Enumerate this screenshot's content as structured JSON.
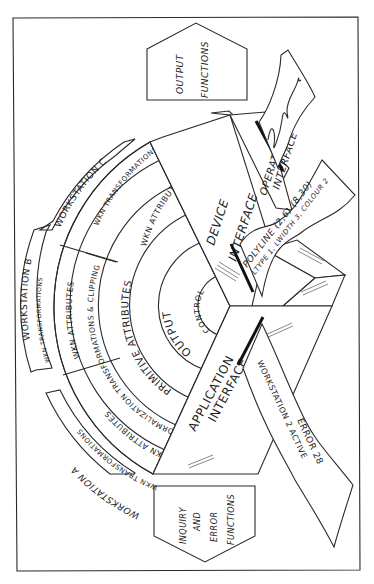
{
  "diagram": {
    "type": "GKS layer model illustration",
    "core": {
      "center_label": "CONTROL",
      "rings": [
        {
          "id": "output",
          "label": "OUTPUT"
        },
        {
          "id": "primitive-attributes",
          "label": "PRIMITIVE ATTRIBUTES"
        },
        {
          "id": "normalization",
          "label": "NORMALIZATION TRANSFORMATIONS & CLIPPING"
        }
      ]
    },
    "workstations": [
      {
        "id": "A",
        "label": "WORKSTATION A",
        "attributes": "WKN ATTRIBUTES",
        "transformations": "WKN TRANSFORMATIONS"
      },
      {
        "id": "B",
        "label": "WORKSTATION B",
        "attributes": "WKN ATTRIBUTES",
        "transformations": "WKN TRANSFORMATIONS"
      },
      {
        "id": "C",
        "label": "WORKSTATION C",
        "attributes": "WKN ATTRIBUTES",
        "transformations": "WKN TRANSFORMATIONS"
      }
    ],
    "interfaces": {
      "application": {
        "line1": "APPLICATION",
        "line2": "INTERFACE"
      },
      "device": {
        "line1": "DEVICE",
        "line2": "INTERFACE"
      },
      "operator": {
        "line1": "OPERATOR",
        "line2": "INTERFACE"
      }
    },
    "function_boxes": {
      "output": {
        "line1": "OUTPUT",
        "line2": "FUNCTIONS"
      },
      "inquiry": {
        "line1": "INQUIRY",
        "line2": "AND",
        "line3": "ERROR",
        "line4": "FUNCTIONS"
      }
    },
    "paper_strips": {
      "device_command": {
        "line1": "POLYLINE (2,6) (8,30)",
        "line2": "LTYPE 1, LWIDTH 3, COLOUR 2"
      },
      "application_message": {
        "line1": "ERROR 28",
        "line2": "WORKSTATION 2 ACTIVE"
      },
      "operator_plot": {
        "content": "wavy-line-plot"
      }
    }
  }
}
